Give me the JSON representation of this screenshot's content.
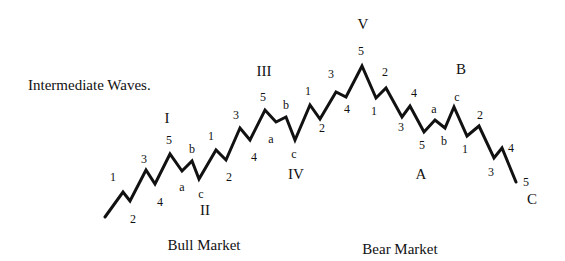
{
  "diagram": {
    "title": "Intermediate Waves.",
    "captions": [
      {
        "text": "Bull Market",
        "x": 204,
        "y": 238
      },
      {
        "text": "Bear Market",
        "x": 400,
        "y": 242
      }
    ],
    "line_color": "#111111",
    "points": [
      [
        105,
        217
      ],
      [
        123,
        192
      ],
      [
        130,
        201
      ],
      [
        146,
        170
      ],
      [
        155,
        184
      ],
      [
        170,
        154
      ],
      [
        182,
        171
      ],
      [
        192,
        161
      ],
      [
        199,
        179
      ],
      [
        216,
        150
      ],
      [
        226,
        160
      ],
      [
        240,
        128
      ],
      [
        250,
        140
      ],
      [
        265,
        110
      ],
      [
        276,
        122
      ],
      [
        286,
        117
      ],
      [
        295,
        140
      ],
      [
        310,
        105
      ],
      [
        320,
        119
      ],
      [
        336,
        92
      ],
      [
        346,
        97
      ],
      [
        362,
        66
      ],
      [
        376,
        98
      ],
      [
        386,
        88
      ],
      [
        402,
        117
      ],
      [
        410,
        106
      ],
      [
        424,
        132
      ],
      [
        435,
        120
      ],
      [
        445,
        128
      ],
      [
        454,
        107
      ],
      [
        467,
        136
      ],
      [
        479,
        126
      ],
      [
        494,
        158
      ],
      [
        502,
        148
      ],
      [
        516,
        182
      ]
    ],
    "minor_labels": [
      {
        "text": "1",
        "x": 113,
        "y": 177
      },
      {
        "text": "2",
        "x": 133,
        "y": 219
      },
      {
        "text": "3",
        "x": 144,
        "y": 159
      },
      {
        "text": "4",
        "x": 160,
        "y": 202
      },
      {
        "text": "5",
        "x": 169,
        "y": 140
      },
      {
        "text": "a",
        "x": 182,
        "y": 187
      },
      {
        "text": "b",
        "x": 192,
        "y": 149
      },
      {
        "text": "c",
        "x": 201,
        "y": 194
      },
      {
        "text": "1",
        "x": 211,
        "y": 136
      },
      {
        "text": "2",
        "x": 229,
        "y": 177
      },
      {
        "text": "3",
        "x": 236,
        "y": 115
      },
      {
        "text": "4",
        "x": 254,
        "y": 157
      },
      {
        "text": "5",
        "x": 263,
        "y": 97
      },
      {
        "text": "a",
        "x": 271,
        "y": 139
      },
      {
        "text": "b",
        "x": 286,
        "y": 105
      },
      {
        "text": "c",
        "x": 294,
        "y": 154
      },
      {
        "text": "1",
        "x": 308,
        "y": 91
      },
      {
        "text": "2",
        "x": 322,
        "y": 128
      },
      {
        "text": "3",
        "x": 331,
        "y": 74
      },
      {
        "text": "4",
        "x": 347,
        "y": 109
      },
      {
        "text": "5",
        "x": 361,
        "y": 51
      },
      {
        "text": "1",
        "x": 374,
        "y": 111
      },
      {
        "text": "2",
        "x": 385,
        "y": 72
      },
      {
        "text": "3",
        "x": 401,
        "y": 127
      },
      {
        "text": "4",
        "x": 414,
        "y": 93
      },
      {
        "text": "5",
        "x": 422,
        "y": 145
      },
      {
        "text": "a",
        "x": 434,
        "y": 109
      },
      {
        "text": "b",
        "x": 444,
        "y": 141
      },
      {
        "text": "c",
        "x": 457,
        "y": 97
      },
      {
        "text": "1",
        "x": 465,
        "y": 149
      },
      {
        "text": "2",
        "x": 480,
        "y": 115
      },
      {
        "text": "3",
        "x": 491,
        "y": 172
      },
      {
        "text": "4",
        "x": 511,
        "y": 148
      },
      {
        "text": "5",
        "x": 526,
        "y": 182
      }
    ],
    "major_labels": [
      {
        "text": "I",
        "x": 167,
        "y": 118
      },
      {
        "text": "II",
        "x": 205,
        "y": 210
      },
      {
        "text": "III",
        "x": 264,
        "y": 71
      },
      {
        "text": "IV",
        "x": 296,
        "y": 174
      },
      {
        "text": "V",
        "x": 363,
        "y": 24
      },
      {
        "text": "A",
        "x": 421,
        "y": 174
      },
      {
        "text": "B",
        "x": 461,
        "y": 69
      },
      {
        "text": "C",
        "x": 532,
        "y": 199
      }
    ]
  }
}
